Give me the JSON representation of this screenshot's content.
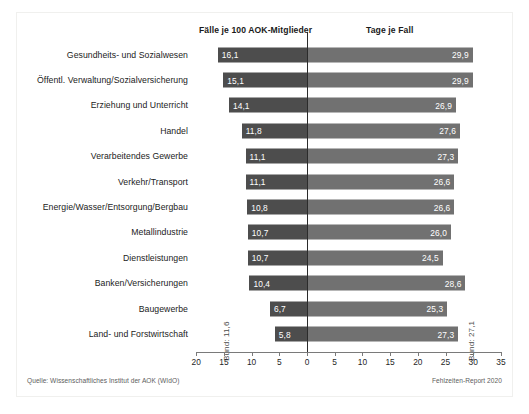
{
  "headers": {
    "left": "Fälle je 100 AOK-Mitglieder",
    "right": "Tage je Fall"
  },
  "annotations": {
    "bund_left": "Bund: 11,6",
    "bund_right": "Bund: 27,1"
  },
  "footer": {
    "source": "Quelle: Wissenschaftliches Institut der AOK (WIdO)",
    "report": "Fehlzeiten-Report 2020"
  },
  "axis": {
    "tick_labels": [
      "20",
      "15",
      "10",
      "5",
      "0",
      "5",
      "10",
      "15",
      "20",
      "25",
      "30",
      "35"
    ],
    "tick_values": [
      -20,
      -15,
      -10,
      -5,
      0,
      5,
      10,
      15,
      20,
      25,
      30,
      35
    ],
    "left_min": 0,
    "left_max": 20,
    "right_min": 0,
    "right_max": 35
  },
  "colors": {
    "bar_left": "#4d4d4d",
    "bar_right": "#717171",
    "zero_line": "#2b2b2b",
    "background": "#ffffff"
  },
  "chart_data": {
    "type": "bar",
    "title": "",
    "subtitle": "",
    "xlabel": "",
    "ylabel": "",
    "grid": false,
    "legend_position": "top",
    "orientation": "horizontal",
    "style": "diverging-bidirectional",
    "categories": [
      "Gesundheits- und Sozialwesen",
      "Öffentl. Verwaltung/Sozialversicherung",
      "Erziehung und Unterricht",
      "Handel",
      "Verarbeitendes Gewerbe",
      "Verkehr/Transport",
      "Energie/Wasser/Entsorgung/Bergbau",
      "Metallindustrie",
      "Dienstleistungen",
      "Banken/Versicherungen",
      "Baugewerbe",
      "Land- und Forstwirtschaft"
    ],
    "series": [
      {
        "name": "Fälle je 100 AOK-Mitglieder",
        "direction": "left",
        "axis_max": 20,
        "values": [
          16.1,
          15.1,
          14.1,
          11.8,
          11.1,
          11.1,
          10.8,
          10.7,
          10.7,
          10.4,
          6.7,
          5.8
        ],
        "labels": [
          "16,1",
          "15,1",
          "14,1",
          "11,8",
          "11,1",
          "11,1",
          "10,8",
          "10,7",
          "10,7",
          "10,4",
          "6,7",
          "5,8"
        ],
        "national_average": 11.6,
        "national_average_label": "Bund: 11,6"
      },
      {
        "name": "Tage je Fall",
        "direction": "right",
        "axis_max": 35,
        "values": [
          29.9,
          29.9,
          26.9,
          27.6,
          27.3,
          26.6,
          26.6,
          26.0,
          24.5,
          28.6,
          25.3,
          27.3
        ],
        "labels": [
          "29,9",
          "29,9",
          "26,9",
          "27,6",
          "27,3",
          "26,6",
          "26,6",
          "26,0",
          "24,5",
          "28,6",
          "25,3",
          "27,3"
        ],
        "national_average": 27.1,
        "national_average_label": "Bund: 27,1"
      }
    ],
    "xlim": [
      -20,
      35
    ],
    "source": "Quelle: Wissenschaftliches Institut der AOK (WIdO)",
    "report": "Fehlzeiten-Report 2020"
  }
}
